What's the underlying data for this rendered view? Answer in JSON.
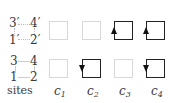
{
  "sites": {
    "top_row": {
      "left_top": "3′",
      "right_top": "4′",
      "left_bottom": "1′",
      "right_bottom": "2′"
    },
    "bottom_row": {
      "left_top": "3",
      "right_top": "4",
      "left_bottom": "1",
      "right_bottom": "2"
    },
    "label": "sites"
  },
  "columns": [
    {
      "name": "c",
      "sub": "1",
      "top": {
        "state": "empty",
        "arrow": null
      },
      "bottom": {
        "state": "empty",
        "arrow": null
      }
    },
    {
      "name": "c",
      "sub": "2",
      "top": {
        "state": "empty",
        "arrow": null
      },
      "bottom": {
        "state": "active",
        "arrow": "down-left"
      }
    },
    {
      "name": "c",
      "sub": "3",
      "top": {
        "state": "active",
        "arrow": "up-left"
      },
      "bottom": {
        "state": "empty",
        "arrow": null
      }
    },
    {
      "name": "c",
      "sub": "4",
      "top": {
        "state": "active",
        "arrow": "up-left"
      },
      "bottom": {
        "state": "active",
        "arrow": "down-left"
      }
    }
  ],
  "colors": {
    "active": "#222222",
    "empty": "#d8d8d8"
  }
}
